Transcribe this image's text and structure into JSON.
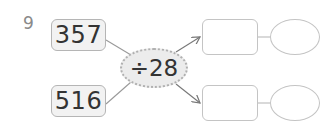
{
  "question": {
    "number": "9",
    "inputs": [
      "357",
      "516"
    ],
    "operation": "÷28",
    "answers": [
      {
        "quotient": "",
        "remainder": ""
      },
      {
        "quotient": "",
        "remainder": ""
      }
    ]
  }
}
